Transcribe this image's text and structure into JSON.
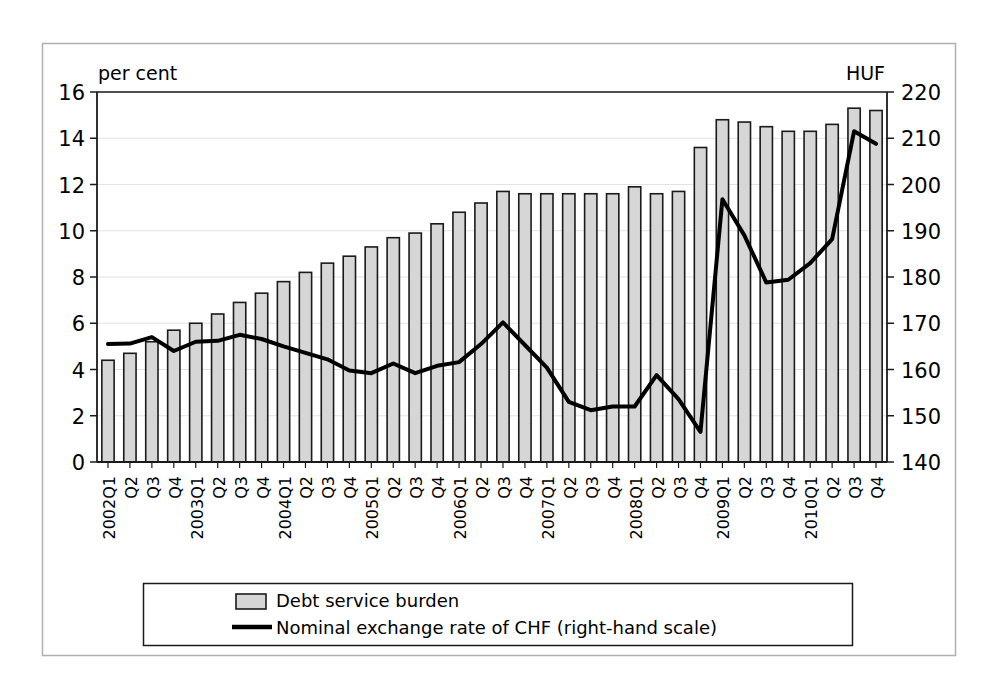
{
  "chart_data": {
    "type": "bar",
    "title": "",
    "subtitle": "",
    "xlabel": "",
    "ylabel": "per cent",
    "y2label": "HUF",
    "ylim": [
      0,
      16
    ],
    "y2lim": [
      140,
      220
    ],
    "yticks": [
      "0",
      "2",
      "4",
      "6",
      "8",
      "10",
      "12",
      "14",
      "16"
    ],
    "y2ticks": [
      "140",
      "150",
      "160",
      "170",
      "180",
      "190",
      "200",
      "210",
      "220"
    ],
    "grid": true,
    "legend_position": "bottom",
    "categories": [
      "2002Q1",
      "Q2",
      "Q3",
      "Q4",
      "2003Q1",
      "Q2",
      "Q3",
      "Q4",
      "2004Q1",
      "Q2",
      "Q3",
      "Q4",
      "2005Q1",
      "Q2",
      "Q3",
      "Q4",
      "2006Q1",
      "Q2",
      "Q3",
      "Q4",
      "2007Q1",
      "Q2",
      "Q3",
      "Q4",
      "2008Q1",
      "Q2",
      "Q3",
      "Q4",
      "2009Q1",
      "Q2",
      "Q3",
      "Q4",
      "2010Q1",
      "Q2",
      "Q3",
      "Q4"
    ],
    "series": [
      {
        "name": "Debt service burden",
        "type": "bar",
        "axis": "left",
        "unit": "per cent",
        "color": "#d6d6d6",
        "edge_color": "#1a1a1a",
        "values": [
          4.4,
          4.7,
          5.2,
          5.7,
          6.0,
          6.4,
          6.9,
          7.3,
          7.8,
          8.2,
          8.6,
          8.9,
          9.3,
          9.7,
          9.9,
          10.3,
          10.8,
          11.2,
          11.7,
          11.6,
          11.6,
          11.6,
          11.6,
          11.6,
          11.9,
          11.6,
          11.7,
          13.6,
          14.8,
          14.7,
          14.5,
          14.3,
          14.3,
          14.6,
          15.3,
          15.2
        ]
      },
      {
        "name": "Nominal exchange rate of CHF (right-hand scale)",
        "type": "line",
        "axis": "right",
        "unit": "HUF",
        "color": "#000000",
        "values": [
          165.5,
          165.6,
          167.0,
          164.0,
          166.0,
          166.2,
          167.5,
          166.6,
          165.0,
          163.6,
          162.2,
          159.8,
          159.2,
          161.3,
          159.2,
          160.8,
          161.6,
          165.5,
          170.2,
          165.3,
          160.4,
          153.0,
          151.2,
          152.0,
          152.0,
          158.8,
          153.6,
          146.5,
          196.8,
          189.0,
          178.8,
          179.4,
          183.0,
          188.2,
          211.5,
          208.8
        ]
      }
    ],
    "legend": [
      {
        "label": "Debt service burden",
        "marker": "bar-swatch"
      },
      {
        "label": "Nominal exchange rate of CHF (right-hand scale)",
        "marker": "line-swatch"
      }
    ]
  },
  "colors": {
    "bar_fill": "#d6d6d6",
    "bar_edge": "#1a1a1a",
    "line": "#000000",
    "grid": "#e3e3e3",
    "axis": "#1a1a1a",
    "frame": "#b0b0b0"
  }
}
